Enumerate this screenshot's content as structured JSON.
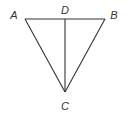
{
  "diagram": {
    "type": "geometry-figure",
    "stroke_color": "#333333",
    "points": {
      "A": {
        "label": "A",
        "x": 25,
        "y": 19,
        "label_x": 14,
        "label_y": 15
      },
      "B": {
        "label": "B",
        "x": 105,
        "y": 19,
        "label_x": 114,
        "label_y": 15
      },
      "C": {
        "label": "C",
        "x": 65,
        "y": 92,
        "label_x": 65,
        "label_y": 106
      },
      "D": {
        "label": "D",
        "x": 65,
        "y": 19,
        "label_x": 65,
        "label_y": 10
      }
    },
    "segments": [
      {
        "from": "A",
        "to": "B"
      },
      {
        "from": "A",
        "to": "C"
      },
      {
        "from": "B",
        "to": "C"
      },
      {
        "from": "D",
        "to": "C"
      }
    ]
  }
}
